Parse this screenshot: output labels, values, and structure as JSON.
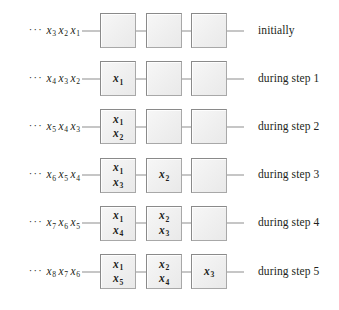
{
  "figure": {
    "cells_per_row": 3,
    "colors": {
      "cell_fill": "#efefef",
      "cell_border": "#a8a8a8",
      "wire": "#8d8d8d",
      "text": "#231f20",
      "background": "#ffffff"
    },
    "ellipsis": "···",
    "rows": [
      {
        "id": "row-initially",
        "caption": "initially",
        "sequence": [
          {
            "base": "x",
            "sub": "3"
          },
          {
            "base": "x",
            "sub": "2"
          },
          {
            "base": "x",
            "sub": "1"
          }
        ],
        "cells": [
          {
            "values": []
          },
          {
            "values": []
          },
          {
            "values": []
          }
        ]
      },
      {
        "id": "row-step-1",
        "caption": "during step 1",
        "sequence": [
          {
            "base": "x",
            "sub": "4"
          },
          {
            "base": "x",
            "sub": "3"
          },
          {
            "base": "x",
            "sub": "2"
          }
        ],
        "cells": [
          {
            "values": [
              {
                "base": "x",
                "sub": "1"
              }
            ]
          },
          {
            "values": []
          },
          {
            "values": []
          }
        ]
      },
      {
        "id": "row-step-2",
        "caption": "during step 2",
        "sequence": [
          {
            "base": "x",
            "sub": "5"
          },
          {
            "base": "x",
            "sub": "4"
          },
          {
            "base": "x",
            "sub": "3"
          }
        ],
        "cells": [
          {
            "values": [
              {
                "base": "x",
                "sub": "1"
              },
              {
                "base": "x",
                "sub": "2"
              }
            ]
          },
          {
            "values": []
          },
          {
            "values": []
          }
        ]
      },
      {
        "id": "row-step-3",
        "caption": "during step 3",
        "sequence": [
          {
            "base": "x",
            "sub": "6"
          },
          {
            "base": "x",
            "sub": "5"
          },
          {
            "base": "x",
            "sub": "4"
          }
        ],
        "cells": [
          {
            "values": [
              {
                "base": "x",
                "sub": "1"
              },
              {
                "base": "x",
                "sub": "3"
              }
            ]
          },
          {
            "values": [
              {
                "base": "x",
                "sub": "2"
              }
            ]
          },
          {
            "values": []
          }
        ]
      },
      {
        "id": "row-step-4",
        "caption": "during step 4",
        "sequence": [
          {
            "base": "x",
            "sub": "7"
          },
          {
            "base": "x",
            "sub": "6"
          },
          {
            "base": "x",
            "sub": "5"
          }
        ],
        "cells": [
          {
            "values": [
              {
                "base": "x",
                "sub": "1"
              },
              {
                "base": "x",
                "sub": "4"
              }
            ]
          },
          {
            "values": [
              {
                "base": "x",
                "sub": "2"
              },
              {
                "base": "x",
                "sub": "3"
              }
            ]
          },
          {
            "values": []
          }
        ]
      },
      {
        "id": "row-step-5",
        "caption": "during step 5",
        "sequence": [
          {
            "base": "x",
            "sub": "8"
          },
          {
            "base": "x",
            "sub": "7"
          },
          {
            "base": "x",
            "sub": "6"
          }
        ],
        "cells": [
          {
            "values": [
              {
                "base": "x",
                "sub": "1"
              },
              {
                "base": "x",
                "sub": "5"
              }
            ]
          },
          {
            "values": [
              {
                "base": "x",
                "sub": "2"
              },
              {
                "base": "x",
                "sub": "4"
              }
            ]
          },
          {
            "values": [
              {
                "base": "x",
                "sub": "3"
              }
            ]
          }
        ]
      }
    ]
  }
}
